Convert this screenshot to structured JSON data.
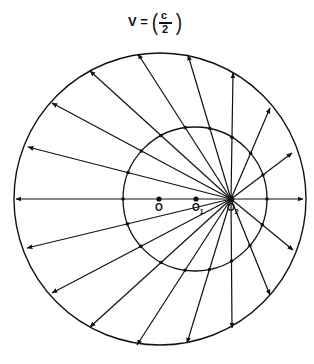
{
  "title": {
    "lhs": "V =",
    "numerator": "c",
    "denominator": "2",
    "left_paren": "(",
    "right_paren": ")"
  },
  "diagram": {
    "outer_circle": {
      "cx": 160,
      "cy": 199,
      "r": 146
    },
    "inner_circle": {
      "cx": 195,
      "cy": 199,
      "r": 72
    },
    "points": [
      {
        "id": "O",
        "label": "O",
        "sub": "",
        "x": 159,
        "y": 199
      },
      {
        "id": "O1",
        "label": "O",
        "sub": "1",
        "x": 196,
        "y": 199
      },
      {
        "id": "O2",
        "label": "O",
        "sub": "2",
        "x": 231,
        "y": 199
      }
    ],
    "ray_origin": {
      "x": 231,
      "y": 199
    },
    "ray_tips": [
      [
        138,
        54
      ],
      [
        188,
        55
      ],
      [
        233,
        73
      ],
      [
        270,
        108
      ],
      [
        292,
        153
      ],
      [
        303,
        199
      ],
      [
        293,
        250
      ],
      [
        270,
        295
      ],
      [
        232,
        328
      ],
      [
        187,
        343
      ],
      [
        137,
        345
      ],
      [
        90,
        327
      ],
      [
        52,
        293
      ],
      [
        27,
        248
      ],
      [
        16,
        199
      ],
      [
        28,
        147
      ],
      [
        52,
        103
      ],
      [
        90,
        71
      ]
    ],
    "line_color": "#111111"
  }
}
